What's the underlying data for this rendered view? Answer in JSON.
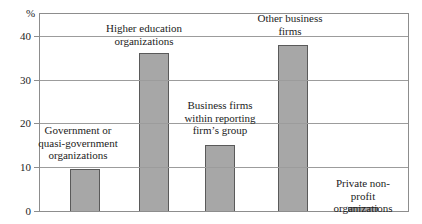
{
  "chart_data": {
    "type": "bar",
    "title": "",
    "ylabel": "%",
    "xlabel": "",
    "ylim": [
      0,
      45
    ],
    "yticks": [
      0,
      10,
      20,
      30,
      40
    ],
    "grid": "horizontal",
    "legend": "none",
    "categories": [
      "Government or quasi-government organizations",
      "Higher education organizations",
      "Business firms within reporting firm’s group",
      "Other business firms",
      "Private non-profit organizations"
    ],
    "values": [
      9.5,
      36,
      15,
      38,
      1
    ],
    "annotations": [
      "Government or\nquasi-government\norganizations",
      "Higher education\norganizations",
      "Business firms\nwithin reporting\nfirm’s group",
      "Other business\nfirms",
      "Private non-profit\norganizations"
    ],
    "colors": {
      "bar_fill": "#a7a7a7",
      "bar_border": "#5a5a5a",
      "gridline": "#9c9c9c",
      "frame": "#8d8d8d",
      "text": "#1c1c1c",
      "background": "#ffffff"
    },
    "layout": {
      "bar_centers_px": [
        45,
        114,
        180,
        253,
        323
      ],
      "bar_width_px": 30,
      "plot_left_px": 39,
      "plot_top_px": 13,
      "plot_width_px": 368,
      "plot_height_px": 197
    }
  }
}
